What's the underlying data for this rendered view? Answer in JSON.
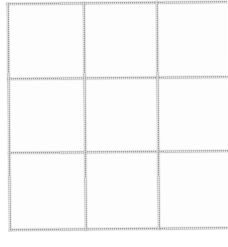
{
  "document": {
    "kind": "scanned-blank-grid",
    "title": "Blank 3x3 Grid",
    "page_background": "#ffffff",
    "paper_tone": "#fdfdfd",
    "line_color": "#a2a2a2",
    "line_weight_px": 2,
    "skew_degrees": -0.55,
    "canvas_width_px": 228,
    "canvas_height_px": 247,
    "content_text": "",
    "notes_visible": ""
  },
  "grid": {
    "name": "3x3 grid",
    "rows": 3,
    "columns": 3,
    "right_column_cropped": true,
    "bottom_margin_blank": true,
    "vertical_lines": [
      {
        "id": "v-left",
        "label": "left border",
        "x": 8
      },
      {
        "id": "v-mid-1",
        "label": "first inner rule",
        "x": 84
      },
      {
        "id": "v-mid-2",
        "label": "second inner rule",
        "x": 157
      }
    ],
    "horizontal_lines": [
      {
        "id": "h-top",
        "label": "top border",
        "y": 3
      },
      {
        "id": "h-mid-1",
        "label": "first inner rule",
        "y": 78
      },
      {
        "id": "h-mid-2",
        "label": "second inner rule",
        "y": 152
      },
      {
        "id": "h-bottom",
        "label": "bottom border",
        "y": 229
      }
    ],
    "cells": [
      {
        "id": "cell-r1c1",
        "row": 1,
        "col": 1,
        "x": 10,
        "y": 5,
        "w": 74,
        "h": 73,
        "value": ""
      },
      {
        "id": "cell-r1c2",
        "row": 1,
        "col": 2,
        "x": 86,
        "y": 5,
        "w": 71,
        "h": 73,
        "value": ""
      },
      {
        "id": "cell-r1c3",
        "row": 1,
        "col": 3,
        "x": 159,
        "y": 5,
        "w": 69,
        "h": 73,
        "value": ""
      },
      {
        "id": "cell-r2c1",
        "row": 2,
        "col": 1,
        "x": 10,
        "y": 80,
        "w": 74,
        "h": 72,
        "value": ""
      },
      {
        "id": "cell-r2c2",
        "row": 2,
        "col": 2,
        "x": 86,
        "y": 80,
        "w": 71,
        "h": 72,
        "value": ""
      },
      {
        "id": "cell-r2c3",
        "row": 2,
        "col": 3,
        "x": 159,
        "y": 80,
        "w": 69,
        "h": 72,
        "value": ""
      },
      {
        "id": "cell-r3c1",
        "row": 3,
        "col": 1,
        "x": 10,
        "y": 154,
        "w": 74,
        "h": 75,
        "value": ""
      },
      {
        "id": "cell-r3c2",
        "row": 3,
        "col": 2,
        "x": 86,
        "y": 154,
        "w": 71,
        "h": 75,
        "value": ""
      },
      {
        "id": "cell-r3c3",
        "row": 3,
        "col": 3,
        "x": 159,
        "y": 154,
        "w": 69,
        "h": 75,
        "value": ""
      }
    ]
  },
  "margins": {
    "left": {
      "label": "left margin",
      "x": 0,
      "y": 0,
      "w": 8,
      "h": 247
    },
    "top": {
      "label": "top margin",
      "x": 0,
      "y": 0,
      "w": 228,
      "h": 3
    },
    "bottom": {
      "label": "bottom margin",
      "x": 0,
      "y": 231,
      "w": 228,
      "h": 16
    }
  }
}
